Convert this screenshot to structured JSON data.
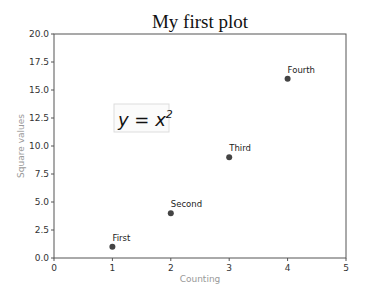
{
  "chart_data": {
    "type": "scatter",
    "title": "My first plot",
    "xlabel": "Counting",
    "ylabel": "Square values",
    "xlim": [
      0,
      5
    ],
    "ylim": [
      0,
      20
    ],
    "x_ticks": [
      "0",
      "1",
      "2",
      "3",
      "4",
      "5"
    ],
    "y_ticks": [
      "0.0",
      "2.5",
      "5.0",
      "7.5",
      "10.0",
      "12.5",
      "15.0",
      "17.5",
      "20.0"
    ],
    "grid": false,
    "points": [
      {
        "x": 1,
        "y": 1,
        "label": "First"
      },
      {
        "x": 2,
        "y": 4,
        "label": "Second"
      },
      {
        "x": 3,
        "y": 9,
        "label": "Third"
      },
      {
        "x": 4,
        "y": 16,
        "label": "Fourth"
      }
    ],
    "annotations": [
      {
        "text": "y = x²",
        "x": 1.1,
        "y": 12.5,
        "boxed": true
      }
    ],
    "marker_color": "#444444"
  }
}
